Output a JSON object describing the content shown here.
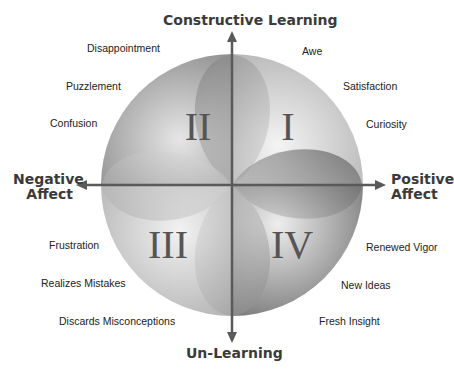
{
  "axes": {
    "top": "Constructive Learning",
    "bottom": "Un-Learning",
    "left_line1": "Negative",
    "left_line2": "Affect",
    "right_line1": "Positive",
    "right_line2": "Affect"
  },
  "quadrants": {
    "q1": "I",
    "q2": "II",
    "q3": "III",
    "q4": "IV"
  },
  "emotions": {
    "q2": [
      "Disappointment",
      "Puzzlement",
      "Confusion"
    ],
    "q1": [
      "Awe",
      "Satisfaction",
      "Curiosity"
    ],
    "q3": [
      "Frustration",
      "Realizes Mistakes",
      "Discards Misconceptions"
    ],
    "q4": [
      "Renewed Vigor",
      "New Ideas",
      "Fresh Insight"
    ]
  },
  "colors": {
    "axis": "#5a5a5a",
    "text": "#222222",
    "title": "#3a3a3a"
  }
}
